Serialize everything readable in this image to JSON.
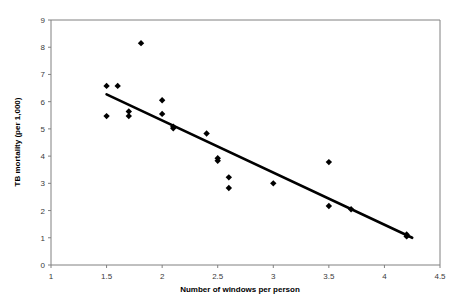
{
  "chart_data": {
    "type": "scatter",
    "title": "",
    "xlabel": "Number of windows per person",
    "ylabel": "TB mortality (per 1,000)",
    "xlim": [
      1,
      4.5
    ],
    "ylim": [
      0,
      9
    ],
    "xticks": [
      "1",
      "1.5",
      "2",
      "2.5",
      "3",
      "3.5",
      "4",
      "4.5"
    ],
    "xtick_values": [
      1,
      1.5,
      2,
      2.5,
      3,
      3.5,
      4,
      4.5
    ],
    "yticks": [
      "0",
      "1",
      "2",
      "3",
      "4",
      "5",
      "6",
      "7",
      "8",
      "9"
    ],
    "ytick_values": [
      0,
      1,
      2,
      3,
      4,
      5,
      6,
      7,
      8,
      9
    ],
    "grid": false,
    "legend": false,
    "marker": "diamond",
    "marker_color": "#000000",
    "points": [
      {
        "x": 1.5,
        "y": 6.58
      },
      {
        "x": 1.5,
        "y": 5.47
      },
      {
        "x": 1.6,
        "y": 6.58
      },
      {
        "x": 1.7,
        "y": 5.64
      },
      {
        "x": 1.7,
        "y": 5.47
      },
      {
        "x": 1.81,
        "y": 8.15
      },
      {
        "x": 2.0,
        "y": 6.05
      },
      {
        "x": 2.0,
        "y": 5.55
      },
      {
        "x": 2.1,
        "y": 5.08
      },
      {
        "x": 2.1,
        "y": 5.02
      },
      {
        "x": 2.4,
        "y": 4.83
      },
      {
        "x": 2.5,
        "y": 3.92
      },
      {
        "x": 2.5,
        "y": 3.83
      },
      {
        "x": 2.6,
        "y": 3.22
      },
      {
        "x": 2.6,
        "y": 2.83
      },
      {
        "x": 3.0,
        "y": 3.0
      },
      {
        "x": 3.5,
        "y": 3.78
      },
      {
        "x": 3.5,
        "y": 2.17
      },
      {
        "x": 3.7,
        "y": 2.05
      },
      {
        "x": 4.2,
        "y": 1.12
      },
      {
        "x": 4.2,
        "y": 1.05
      }
    ],
    "trendline": {
      "x_start": 1.5,
      "y_start": 6.27,
      "x_end": 4.25,
      "y_end": 1.0,
      "color": "#000000"
    }
  }
}
